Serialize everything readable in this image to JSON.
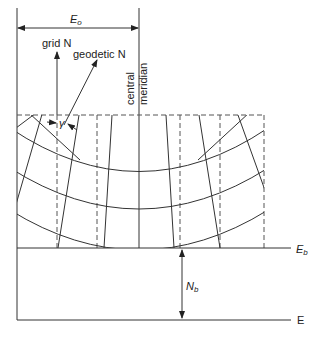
{
  "diagram": {
    "labels": {
      "false_easting": "E",
      "false_easting_sub": "o",
      "grid_north": "grid N",
      "geodetic_north": "geodetic N",
      "central_meridian_line1": "central",
      "central_meridian_line2": "meridian",
      "convergence": "γ",
      "easting_axis_base": "E",
      "easting_axis_base_sub": "b",
      "northing_base": "N",
      "northing_base_sub": "b",
      "easting_axis": "E"
    },
    "colors": {
      "line": "#333333",
      "background": "#ffffff"
    }
  }
}
